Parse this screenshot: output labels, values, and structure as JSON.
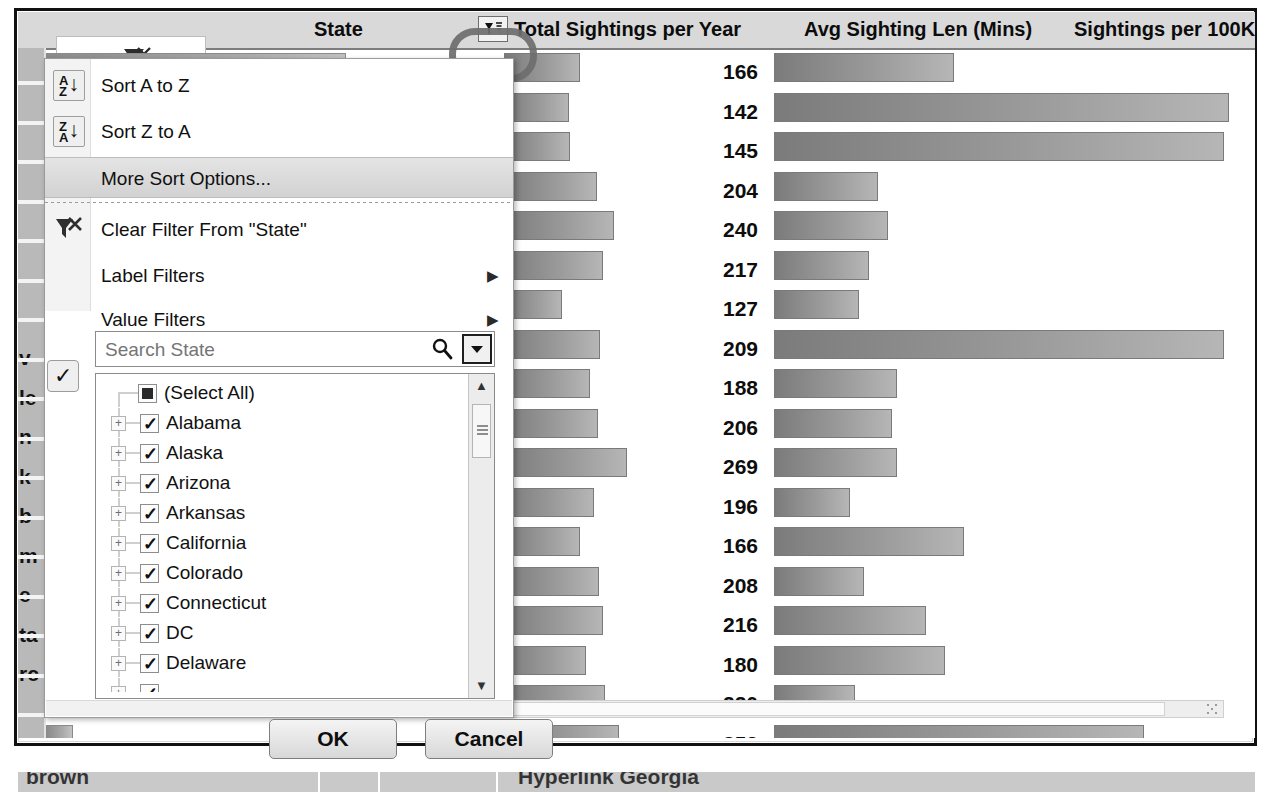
{
  "window": {
    "title": "Excel PivotTable — State filter dropdown"
  },
  "table": {
    "headers": {
      "state": "State",
      "total_sightings": "Total Sightings per Year",
      "avg_len": "Avg Sighting Len (Mins)",
      "per_100k": "Sightings per 100K"
    },
    "filter_button_icon": "filter-sort-icon",
    "rows": [
      {
        "total": "37.6",
        "avg": "166",
        "per100k": ""
      },
      {
        "total": "17.8",
        "avg": "142",
        "per100k": ""
      },
      {
        "total": "17.1",
        "avg": "145",
        "per100k": ""
      },
      {
        "total": "11.6",
        "avg": "204",
        "per100k": ""
      },
      {
        "total": "9.8",
        "avg": "240",
        "per100k": ""
      },
      {
        "total": "9.3",
        "avg": "217",
        "per100k": ""
      },
      {
        "total": "8.8",
        "avg": "127",
        "per100k": ""
      },
      {
        "total": "7.5",
        "avg": "209",
        "per100k": ""
      },
      {
        "total": "6.8",
        "avg": "188",
        "per100k": ""
      },
      {
        "total": "5.8",
        "avg": "206",
        "per100k": ""
      },
      {
        "total": "5.5",
        "avg": "269",
        "per100k": ""
      },
      {
        "total": "4.6",
        "avg": "196",
        "per100k": ""
      },
      {
        "total": "4.5",
        "avg": "166",
        "per100k": ""
      },
      {
        "total": "4.2",
        "avg": "208",
        "per100k": ""
      },
      {
        "total": "3.9",
        "avg": "216",
        "per100k": ""
      },
      {
        "total": "3.6",
        "avg": "180",
        "per100k": ""
      },
      {
        "total": "3.6",
        "avg": "220",
        "per100k": ""
      },
      {
        "total": "3.4",
        "avg": "252",
        "per100k": ""
      },
      {
        "total": "3.3",
        "avg": "157",
        "per100k": ""
      },
      {
        "total": "3.3",
        "avg": "306",
        "per100k": ""
      }
    ],
    "left_edge_fragments": [
      "v",
      "le",
      "n",
      "k",
      "b",
      "m",
      "e",
      "ta",
      "rc"
    ],
    "bottom_clipped_text": {
      "left": "brown",
      "right": "Hyperlink  Georgia"
    }
  },
  "chart_data": {
    "type": "bar",
    "xlabel": "",
    "ylabel": "",
    "categories": [
      "1",
      "2",
      "3",
      "4",
      "5",
      "6",
      "7",
      "8",
      "9",
      "10",
      "11",
      "12",
      "13",
      "14",
      "15",
      "16",
      "17",
      "18",
      "19",
      "20"
    ],
    "series": [
      {
        "name": "Total Sightings per Year",
        "values": [
          37.6,
          17.8,
          17.1,
          11.6,
          9.8,
          9.3,
          8.8,
          7.5,
          6.8,
          5.8,
          5.5,
          4.6,
          4.5,
          4.2,
          3.9,
          3.6,
          3.6,
          3.4,
          3.3,
          3.3
        ]
      },
      {
        "name": "Avg Sighting Len (Mins)",
        "values": [
          166,
          142,
          145,
          204,
          240,
          217,
          127,
          209,
          188,
          206,
          269,
          196,
          166,
          208,
          216,
          180,
          220,
          252,
          157,
          306
        ]
      },
      {
        "name": "Sightings per 100K",
        "values": [
          38,
          96,
          95,
          22,
          24,
          20,
          18,
          95,
          26,
          25,
          26,
          16,
          40,
          19,
          32,
          36,
          17,
          78,
          22,
          44
        ]
      }
    ],
    "grid": false,
    "legend": "none",
    "note": "Excel in-cell data bars; lengths read relative to each column's max"
  },
  "menu": {
    "items": [
      {
        "label": "Sort A to Z",
        "accel": "S",
        "icon": "sort-az-icon",
        "has_submenu": false,
        "selected": false
      },
      {
        "label": "Sort Z to A",
        "accel": "S",
        "icon": "sort-za-icon",
        "has_submenu": false,
        "selected": false
      },
      {
        "label": "More Sort Options...",
        "accel": "M",
        "icon": "",
        "has_submenu": false,
        "selected": true
      },
      {
        "label": "Clear Filter From \"State\"",
        "accel": "C",
        "icon": "clear-filter-icon",
        "has_submenu": false,
        "selected": false
      },
      {
        "label": "Label Filters",
        "accel": "L",
        "icon": "",
        "has_submenu": true,
        "selected": false
      },
      {
        "label": "Value Filters",
        "accel": "V",
        "icon": "",
        "has_submenu": true,
        "selected": false
      }
    ],
    "search": {
      "placeholder": "Search State",
      "value": "",
      "icon": "search-icon",
      "dropdown_icon": "chevron-down-icon"
    },
    "list": [
      {
        "label": "(Select All)",
        "checked": "mixed",
        "expandable": false
      },
      {
        "label": "Alabama",
        "checked": "true",
        "expandable": true
      },
      {
        "label": "Alaska",
        "checked": "true",
        "expandable": true
      },
      {
        "label": "Arizona",
        "checked": "true",
        "expandable": true
      },
      {
        "label": "Arkansas",
        "checked": "true",
        "expandable": true
      },
      {
        "label": "California",
        "checked": "true",
        "expandable": true
      },
      {
        "label": "Colorado",
        "checked": "true",
        "expandable": true
      },
      {
        "label": "Connecticut",
        "checked": "true",
        "expandable": true
      },
      {
        "label": "DC",
        "checked": "true",
        "expandable": true
      },
      {
        "label": "Delaware",
        "checked": "true",
        "expandable": true
      }
    ],
    "scroll": {
      "up_icon": "scroll-up-icon",
      "down_icon": "scroll-down-icon"
    },
    "ok_label": "OK",
    "cancel_label": "Cancel"
  },
  "annotation": {
    "shape": "rounded-rect-highlight",
    "target": "column-filter-button"
  }
}
